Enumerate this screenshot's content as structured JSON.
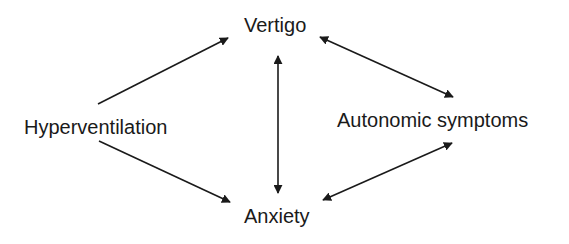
{
  "diagram": {
    "type": "causal-flow",
    "nodes": [
      {
        "id": "hyperventilation",
        "label": "Hyperventilation"
      },
      {
        "id": "vertigo",
        "label": "Vertigo"
      },
      {
        "id": "anxiety",
        "label": "Anxiety"
      },
      {
        "id": "autonomic",
        "label": "Autonomic symptoms"
      }
    ],
    "edges": [
      {
        "from": "hyperventilation",
        "to": "vertigo",
        "direction": "one-way"
      },
      {
        "from": "hyperventilation",
        "to": "anxiety",
        "direction": "one-way"
      },
      {
        "from": "vertigo",
        "to": "anxiety",
        "direction": "bidirectional"
      },
      {
        "from": "vertigo",
        "to": "autonomic",
        "direction": "bidirectional"
      },
      {
        "from": "autonomic",
        "to": "anxiety",
        "direction": "bidirectional"
      }
    ],
    "colors": {
      "ink": "#1a1a1a",
      "background": "#ffffff"
    }
  }
}
